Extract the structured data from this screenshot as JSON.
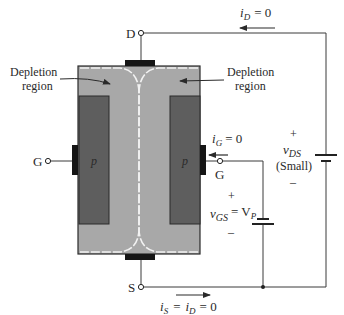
{
  "diagram": {
    "terminals": {
      "drain": "D",
      "source": "S",
      "gate_left": "G",
      "gate_right": "G"
    },
    "regions": {
      "p_left": "p",
      "p_right": "p",
      "depletion_left_line1": "Depletion",
      "depletion_left_line2": "region",
      "depletion_right_line1": "Depletion",
      "depletion_right_line2": "region"
    },
    "currents": {
      "i_d_main": "i",
      "i_d_sub": "D",
      "i_d_eq": "= 0",
      "i_g_main": "i",
      "i_g_sub": "G",
      "i_g_eq": "= 0",
      "i_s_main": "i",
      "i_s_sub": "S",
      "i_s_eq1": "=",
      "i_s_mid_main": "i",
      "i_s_mid_sub": "D",
      "i_s_eq2": "= 0"
    },
    "sources": {
      "vds_plus": "+",
      "vds_main": "v",
      "vds_sub": "DS",
      "vds_note": "(Small)",
      "vds_minus": "–",
      "vgs_plus": "+",
      "vgs_main": "v",
      "vgs_sub": "GS",
      "vgs_eq": "= V",
      "vgs_eq_sub": "P",
      "vgs_minus": "–"
    },
    "colors": {
      "channel": "#a8a8a8",
      "p_region": "#5e5e5e",
      "contact": "#151515",
      "wire": "#3a3a3a",
      "depletion_boundary": "#f2f2f2"
    }
  }
}
